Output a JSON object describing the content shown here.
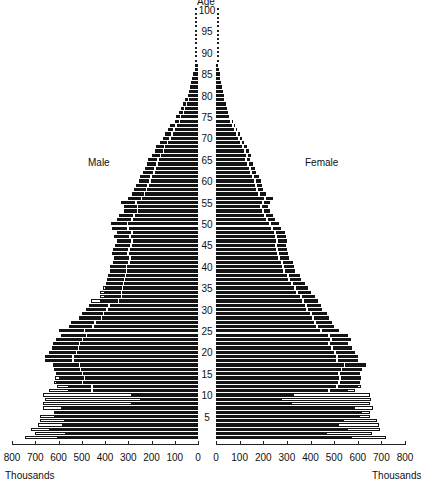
{
  "chart_data": {
    "type": "bar",
    "subtype": "population-pyramid",
    "title": "",
    "y_axis_label": "Age",
    "x_unit_label": "Thousands",
    "left_series_label": "Male",
    "right_series_label": "Female",
    "age_ticks": [
      100,
      95,
      90,
      85,
      80,
      75,
      70,
      65,
      60,
      55,
      50,
      45,
      40,
      35,
      30,
      25,
      20,
      15,
      10,
      5
    ],
    "male_x_ticks": [
      800,
      700,
      600,
      500,
      400,
      300,
      200,
      100,
      0
    ],
    "female_x_ticks": [
      0,
      100,
      200,
      300,
      400,
      500,
      600,
      700,
      800
    ],
    "xlim": [
      0,
      800
    ],
    "ylim": [
      0,
      100
    ],
    "ages": [
      0,
      1,
      2,
      3,
      4,
      5,
      6,
      7,
      8,
      9,
      10,
      11,
      12,
      13,
      14,
      15,
      16,
      17,
      18,
      19,
      20,
      21,
      22,
      23,
      24,
      25,
      26,
      27,
      28,
      29,
      30,
      31,
      32,
      33,
      34,
      35,
      36,
      37,
      38,
      39,
      40,
      41,
      42,
      43,
      44,
      45,
      46,
      47,
      48,
      49,
      50,
      51,
      52,
      53,
      54,
      55,
      56,
      57,
      58,
      59,
      60,
      61,
      62,
      63,
      64,
      65,
      66,
      67,
      68,
      69,
      70,
      71,
      72,
      73,
      74,
      75,
      76,
      77,
      78,
      79,
      80,
      81,
      82,
      83,
      84,
      85,
      86,
      87,
      88,
      89,
      90,
      91,
      92,
      93,
      94,
      95,
      96,
      97,
      98,
      99,
      100
    ],
    "series": [
      {
        "name": "Male",
        "total": [
          745,
          700,
          720,
          690,
          680,
          680,
          620,
          665,
          665,
          660,
          665,
          640,
          605,
          620,
          615,
          610,
          620,
          625,
          660,
          660,
          640,
          630,
          625,
          610,
          590,
          600,
          555,
          545,
          510,
          500,
          480,
          470,
          460,
          420,
          420,
          410,
          395,
          390,
          385,
          380,
          380,
          365,
          360,
          370,
          365,
          355,
          350,
          360,
          350,
          370,
          375,
          350,
          340,
          320,
          320,
          330,
          300,
          285,
          275,
          265,
          255,
          250,
          235,
          230,
          220,
          215,
          200,
          185,
          180,
          165,
          150,
          140,
          130,
          120,
          100,
          95,
          80,
          75,
          65,
          55,
          45,
          40,
          35,
          30,
          25,
          20,
          15,
          12,
          10,
          8,
          6,
          5,
          4,
          3,
          3,
          3,
          3,
          2,
          2,
          2,
          2
        ],
        "black": [
          605,
          570,
          640,
          585,
          575,
          620,
          620,
          590,
          290,
          250,
          290,
          560,
          560,
          610,
          600,
          610,
          620,
          625,
          660,
          660,
          640,
          630,
          625,
          610,
          590,
          600,
          555,
          545,
          510,
          500,
          480,
          470,
          420,
          405,
          405,
          400,
          395,
          390,
          385,
          380,
          380,
          365,
          360,
          370,
          365,
          355,
          350,
          360,
          350,
          370,
          375,
          350,
          340,
          320,
          320,
          330,
          300,
          285,
          275,
          265,
          255,
          250,
          235,
          230,
          220,
          215,
          200,
          185,
          180,
          165,
          150,
          140,
          130,
          120,
          100,
          95,
          80,
          75,
          65,
          55,
          45,
          40,
          35,
          30,
          25,
          20,
          15,
          12,
          10,
          8,
          6,
          5,
          4,
          3,
          3,
          3,
          3,
          2,
          2,
          2,
          2
        ]
      },
      {
        "name": "Female",
        "total": [
          720,
          660,
          695,
          690,
          680,
          650,
          650,
          665,
          650,
          655,
          650,
          590,
          615,
          610,
          615,
          610,
          620,
          635,
          600,
          600,
          590,
          575,
          560,
          570,
          560,
          520,
          500,
          490,
          480,
          470,
          450,
          445,
          430,
          420,
          400,
          390,
          375,
          360,
          355,
          335,
          330,
          325,
          310,
          305,
          300,
          295,
          300,
          295,
          290,
          275,
          265,
          250,
          240,
          230,
          220,
          230,
          240,
          210,
          200,
          195,
          190,
          180,
          170,
          165,
          155,
          145,
          150,
          140,
          130,
          120,
          110,
          100,
          90,
          80,
          70,
          65,
          60,
          55,
          50,
          42,
          35,
          30,
          25,
          20,
          18,
          15,
          12,
          10,
          8,
          6,
          5,
          4,
          3,
          3,
          3,
          3,
          2,
          2,
          2,
          2,
          2
        ],
        "black": [
          575,
          470,
          560,
          520,
          540,
          610,
          620,
          590,
          320,
          280,
          330,
          560,
          600,
          610,
          615,
          610,
          620,
          635,
          600,
          600,
          590,
          575,
          560,
          570,
          560,
          520,
          500,
          490,
          480,
          470,
          450,
          445,
          430,
          420,
          400,
          390,
          375,
          360,
          355,
          335,
          330,
          325,
          310,
          305,
          300,
          295,
          300,
          295,
          290,
          275,
          265,
          250,
          240,
          230,
          220,
          230,
          240,
          210,
          200,
          195,
          190,
          180,
          170,
          165,
          155,
          145,
          150,
          140,
          130,
          120,
          110,
          100,
          90,
          80,
          70,
          65,
          60,
          55,
          50,
          42,
          35,
          30,
          25,
          20,
          18,
          15,
          12,
          10,
          8,
          6,
          5,
          4,
          3,
          3,
          3,
          3,
          2,
          2,
          2,
          2,
          2
        ]
      }
    ],
    "colors": {
      "bar": "#141414",
      "outline_bar": "#ffffff",
      "reference_line": "#ffffff"
    }
  }
}
